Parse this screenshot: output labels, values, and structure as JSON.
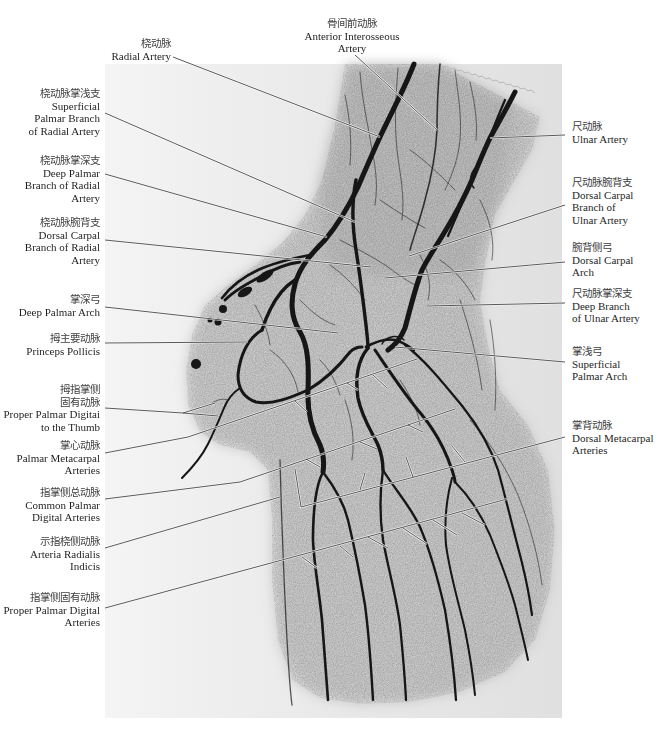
{
  "labels": {
    "top": [
      {
        "zh": [
          "桡动脉"
        ],
        "en": [
          "Radial Artery"
        ]
      },
      {
        "zh": [
          "骨间前动脉"
        ],
        "en": [
          "Anterior Interosseous",
          "Artery"
        ]
      }
    ],
    "left": [
      {
        "zh": [
          "桡动脉掌浅支"
        ],
        "en": [
          "Superficial",
          "Palmar Branch",
          "of Radial Artery"
        ]
      },
      {
        "zh": [
          "桡动脉掌深支"
        ],
        "en": [
          "Deep Palmar",
          "Branch of Radial",
          "Artery"
        ]
      },
      {
        "zh": [
          "桡动脉腕背支"
        ],
        "en": [
          "Dorsal Carpal",
          "Branch of Radial",
          "Artery"
        ]
      },
      {
        "zh": [
          "掌深弓"
        ],
        "en": [
          "Deep Palmar Arch"
        ]
      },
      {
        "zh": [
          "拇主要动脉"
        ],
        "en": [
          "Princeps Pollicis"
        ]
      },
      {
        "zh": [
          "拇指掌侧",
          "固有动脉"
        ],
        "en": [
          "Proper Palmar Digitai",
          "to the Thumb"
        ]
      },
      {
        "zh": [
          "掌心动脉"
        ],
        "en": [
          "Palmar Metacarpal",
          "Arteries"
        ]
      },
      {
        "zh": [
          "指掌侧总动脉"
        ],
        "en": [
          "Common Palmar",
          "Digital Arteries"
        ]
      },
      {
        "zh": [
          "示指桡侧动脉"
        ],
        "en": [
          "Arteria Radialis",
          "Indicis"
        ]
      },
      {
        "zh": [
          "指掌侧固有动脉"
        ],
        "en": [
          "Proper Palmar Digital",
          "Arteries"
        ]
      }
    ],
    "right": [
      {
        "zh": [
          "尺动脉"
        ],
        "en": [
          "Ulnar Artery"
        ]
      },
      {
        "zh": [
          "尺动脉腕背支"
        ],
        "en": [
          "Dorsal Carpal",
          "Branch of",
          "Ulnar Artery"
        ]
      },
      {
        "zh": [
          "腕背侧弓"
        ],
        "en": [
          "Dorsal Carpal",
          "Arch"
        ]
      },
      {
        "zh": [
          "尺动脉掌深支"
        ],
        "en": [
          "Deep Branch",
          "of Ulnar Artery"
        ]
      },
      {
        "zh": [
          "掌浅弓"
        ],
        "en": [
          "Superficial",
          "Palmar Arch"
        ]
      },
      {
        "zh": [
          "掌背动脉"
        ],
        "en": [
          "Dorsal Metacarpal",
          "Arteries"
        ]
      }
    ]
  },
  "colors": {
    "page_background": "#ffffff",
    "film": "#e6e6e6",
    "soft_tissue": "#c4c4c4",
    "vessel": "#141414",
    "leader_line": "#3a3a3a",
    "text": "#222222"
  }
}
